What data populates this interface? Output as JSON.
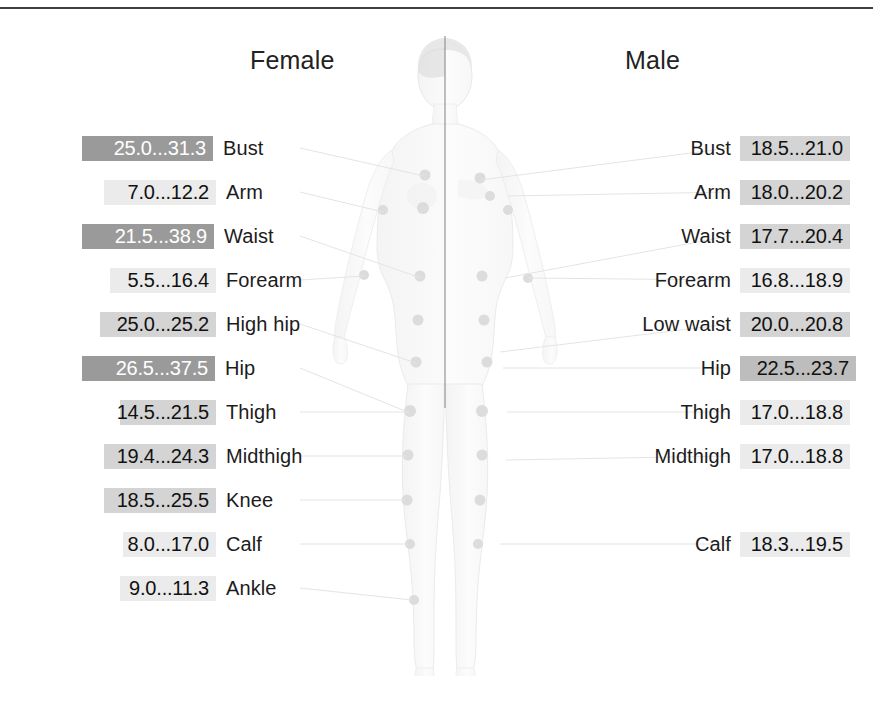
{
  "headings": {
    "female": "Female",
    "male": "Male"
  },
  "colors": {
    "bar_dark": "#9a9a9a",
    "bar_mid": "#bdbdbd",
    "bar_light": "#d4d4d4",
    "bar_faint": "#ebebeb",
    "text_dark": "#1c1c1c",
    "text_light": "#ffffff",
    "rule": "#3f3f3f",
    "connector": "#e2e2e2",
    "body_fill": "#fbfbfb",
    "body_outline": "#e6e6e6",
    "dot": "#dddddd",
    "divider": "#7a7a7a"
  },
  "female": {
    "title": "Female",
    "rows": [
      {
        "label": "Bust",
        "value": "25.0...31.3",
        "min": 25.0,
        "max": 31.3,
        "bar_left": 82,
        "bar_width": 131,
        "shade": "dark",
        "text": "light",
        "top": 135,
        "dot_x": 486,
        "dot_y": 208
      },
      {
        "label": "Arm",
        "value": "7.0...12.2",
        "min": 7.0,
        "max": 12.2,
        "bar_left": 104,
        "bar_width": 112,
        "shade": "faint",
        "text": "dark",
        "top": 179,
        "dot_x": 383,
        "dot_y": 222
      },
      {
        "label": "Waist",
        "value": "21.5...38.9",
        "min": 21.5,
        "max": 38.9,
        "bar_left": 82,
        "bar_width": 132,
        "shade": "dark",
        "text": "light",
        "top": 223,
        "dot_x": 472,
        "dot_y": 277
      },
      {
        "label": "Forearm",
        "value": "5.5...16.4",
        "min": 5.5,
        "max": 16.4,
        "bar_left": 110,
        "bar_width": 106,
        "shade": "faint",
        "text": "dark",
        "top": 267,
        "dot_x": 355,
        "dot_y": 288
      },
      {
        "label": "High hip",
        "value": "25.0...25.2",
        "min": 25.0,
        "max": 25.2,
        "bar_left": 100,
        "bar_width": 116,
        "shade": "light",
        "text": "dark",
        "top": 311,
        "dot_x": 470,
        "dot_y": 320
      },
      {
        "label": "Hip",
        "value": "26.5...37.5",
        "min": 26.5,
        "max": 37.5,
        "bar_left": 82,
        "bar_width": 133,
        "shade": "dark",
        "text": "light",
        "top": 355,
        "dot_x": 466,
        "dot_y": 363
      },
      {
        "label": "Thigh",
        "value": "14.5...21.5",
        "min": 14.5,
        "max": 21.5,
        "bar_left": 120,
        "bar_width": 96,
        "shade": "light",
        "text": "dark",
        "top": 399,
        "dot_x": 446,
        "dot_y": 408
      },
      {
        "label": "Midthigh",
        "value": "19.4...24.3",
        "min": 19.4,
        "max": 24.3,
        "bar_left": 104,
        "bar_width": 112,
        "shade": "light",
        "text": "dark",
        "top": 443,
        "dot_x": 442,
        "dot_y": 453
      },
      {
        "label": "Knee",
        "value": "18.5...25.5",
        "min": 18.5,
        "max": 25.5,
        "bar_left": 104,
        "bar_width": 112,
        "shade": "light",
        "text": "dark",
        "top": 487,
        "dot_x": 438,
        "dot_y": 497
      },
      {
        "label": "Calf",
        "value": "8.0...17.0",
        "min": 8.0,
        "max": 17.0,
        "bar_left": 123,
        "bar_width": 93,
        "shade": "faint",
        "text": "dark",
        "top": 531,
        "dot_x": 434,
        "dot_y": 540
      },
      {
        "label": "Ankle",
        "value": "9.0...11.3",
        "min": 9.0,
        "max": 11.3,
        "bar_left": 120,
        "bar_width": 96,
        "shade": "faint",
        "text": "dark",
        "top": 575,
        "dot_x": 427,
        "dot_y": 598
      }
    ]
  },
  "male": {
    "title": "Male",
    "rows": [
      {
        "label": "Bust",
        "value": "18.5...21.0",
        "min": 18.5,
        "max": 21.0,
        "bar_left": 740,
        "bar_width": 110,
        "shade": "light",
        "text": "dark",
        "top": 135,
        "dot_x": 540,
        "dot_y": 208
      },
      {
        "label": "Arm",
        "value": "18.0...20.2",
        "min": 18.0,
        "max": 20.2,
        "bar_left": 740,
        "bar_width": 110,
        "shade": "light",
        "text": "dark",
        "top": 179,
        "dot_x": 560,
        "dot_y": 226
      },
      {
        "label": "Waist",
        "value": "17.7...20.4",
        "min": 17.7,
        "max": 20.4,
        "bar_left": 740,
        "bar_width": 110,
        "shade": "light",
        "text": "dark",
        "top": 223,
        "dot_x": 489,
        "dot_y": 270
      },
      {
        "label": "Forearm",
        "value": "16.8...18.9",
        "min": 16.8,
        "max": 18.9,
        "bar_left": 740,
        "bar_width": 110,
        "shade": "faint",
        "text": "dark",
        "top": 267,
        "dot_x": 578,
        "dot_y": 290
      },
      {
        "label": "Low waist",
        "value": "20.0...20.8",
        "min": 20.0,
        "max": 20.8,
        "bar_left": 740,
        "bar_width": 110,
        "shade": "light",
        "text": "dark",
        "top": 311,
        "dot_x": 492,
        "dot_y": 322
      },
      {
        "label": "Hip",
        "value": "22.5...23.7",
        "min": 22.5,
        "max": 23.7,
        "bar_left": 740,
        "bar_width": 116,
        "shade": "mid",
        "text": "dark",
        "top": 355,
        "dot_x": 497,
        "dot_y": 363
      },
      {
        "label": "Thigh",
        "value": "17.0...18.8",
        "min": 17.0,
        "max": 18.8,
        "bar_left": 740,
        "bar_width": 110,
        "shade": "faint",
        "text": "dark",
        "top": 399,
        "dot_x": 504,
        "dot_y": 412
      },
      {
        "label": "Midthigh",
        "value": "17.0...18.8",
        "min": 17.0,
        "max": 18.8,
        "bar_left": 740,
        "bar_width": 110,
        "shade": "faint",
        "text": "dark",
        "top": 443,
        "dot_x": 510,
        "dot_y": 462
      },
      {
        "label": "Calf",
        "value": "18.3...19.5",
        "min": 18.3,
        "max": 19.5,
        "bar_left": 740,
        "bar_width": 110,
        "shade": "faint",
        "text": "dark",
        "top": 531,
        "dot_x": 514,
        "dot_y": 540
      }
    ]
  },
  "chart_data": {
    "type": "table",
    "columns": [
      "Measurement site",
      "Female range",
      "Male range"
    ],
    "note": "Values shown as min...max pairs; bar shading encodes magnitude of the range.",
    "rows": [
      {
        "site": "Bust",
        "female": "25.0...31.3",
        "male": "18.5...21.0"
      },
      {
        "site": "Arm",
        "female": "7.0...12.2",
        "male": "18.0...20.2"
      },
      {
        "site": "Waist",
        "female": "21.5...38.9",
        "male": "17.7...20.4"
      },
      {
        "site": "Forearm",
        "female": "5.5...16.4",
        "male": "16.8...18.9"
      },
      {
        "site": "High hip",
        "female": "25.0...25.2",
        "male": ""
      },
      {
        "site": "Low waist",
        "female": "",
        "male": "20.0...20.8"
      },
      {
        "site": "Hip",
        "female": "26.5...37.5",
        "male": "22.5...23.7"
      },
      {
        "site": "Thigh",
        "female": "14.5...21.5",
        "male": "17.0...18.8"
      },
      {
        "site": "Midthigh",
        "female": "19.4...24.3",
        "male": "17.0...18.8"
      },
      {
        "site": "Knee",
        "female": "18.5...25.5",
        "male": ""
      },
      {
        "site": "Calf",
        "female": "8.0...17.0",
        "male": "18.3...19.5"
      },
      {
        "site": "Ankle",
        "female": "9.0...11.3",
        "male": ""
      }
    ]
  }
}
